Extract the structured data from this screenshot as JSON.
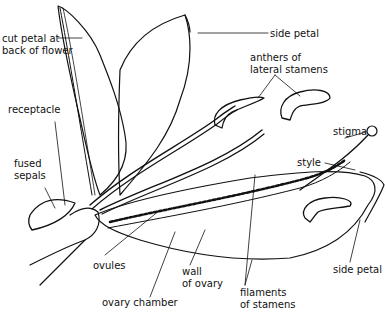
{
  "diagram": {
    "labels": [
      {
        "id": "cut-petal",
        "text": "cut petal at\nback of flower",
        "x": 2,
        "y": 33
      },
      {
        "id": "side-petal-top",
        "text": "side petal",
        "x": 270,
        "y": 28
      },
      {
        "id": "anthers",
        "text": "anthers of\nlateral stamens",
        "x": 250,
        "y": 52
      },
      {
        "id": "receptacle",
        "text": "receptacle",
        "x": 8,
        "y": 104
      },
      {
        "id": "stigma",
        "text": "stigma",
        "x": 333,
        "y": 126
      },
      {
        "id": "fused-sepals",
        "text": "fused\nsepals",
        "x": 14,
        "y": 160
      },
      {
        "id": "style",
        "text": "style",
        "x": 297,
        "y": 158
      },
      {
        "id": "ovules",
        "text": "ovules",
        "x": 93,
        "y": 261
      },
      {
        "id": "wall-of-ovary",
        "text": "wall\nof ovary",
        "x": 182,
        "y": 266
      },
      {
        "id": "side-petal-bottom",
        "text": "side petal",
        "x": 333,
        "y": 264
      },
      {
        "id": "ovary-chamber",
        "text": "ovary chamber",
        "x": 102,
        "y": 298
      },
      {
        "id": "filaments",
        "text": "filaments\nof stamens",
        "x": 240,
        "y": 288
      }
    ],
    "colors": {
      "ink": "#111111",
      "background": "#ffffff"
    }
  }
}
